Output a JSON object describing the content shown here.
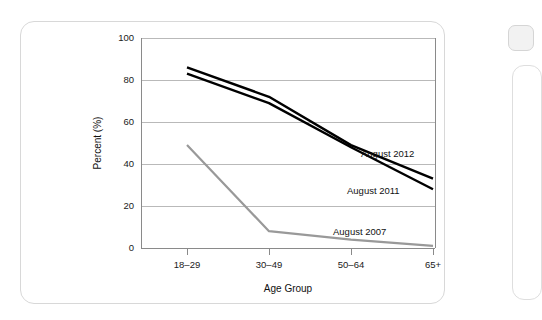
{
  "figure": {
    "name": "age-group-percent-line-chart"
  },
  "chart_data": {
    "type": "line",
    "title": "",
    "xlabel": "Age Group",
    "ylabel": "Percent (%)",
    "categories": [
      "18–29",
      "30–49",
      "50–64",
      "65+"
    ],
    "ylim": [
      0,
      100
    ],
    "yticks": [
      0,
      20,
      40,
      60,
      80,
      100
    ],
    "ytick_labels": [
      "0",
      "20",
      "40",
      "60",
      "80",
      "100"
    ],
    "grid": "horizontal",
    "legend": "inline-annotations",
    "series": [
      {
        "name": "August 2012",
        "label": "August 2012",
        "color": "#000000",
        "values": [
          86,
          72,
          49,
          33
        ]
      },
      {
        "name": "August 2011",
        "label": "August 2011",
        "color": "#000000",
        "values": [
          83,
          69,
          48,
          28
        ]
      },
      {
        "name": "August 2007",
        "label": "August 2007",
        "color": "#999999",
        "values": [
          49,
          8,
          4,
          1
        ]
      }
    ],
    "annotations": [
      {
        "text": "August 2012",
        "series": "August 2012"
      },
      {
        "text": "August 2011",
        "series": "August 2011"
      },
      {
        "text": "August 2007",
        "series": "August 2007"
      }
    ]
  },
  "colors": {
    "line_dark": "#000000",
    "line_gray": "#999999",
    "axis": "#8a8a8a",
    "grid": "#a8a8a8",
    "card_border": "#d8d8d8",
    "page_background": "#ffffff"
  }
}
